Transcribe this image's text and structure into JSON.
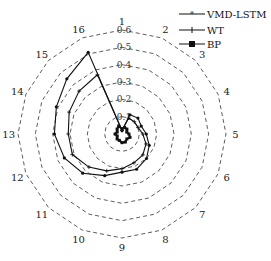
{
  "chart_data": {
    "type": "radar",
    "title": "",
    "axes": [
      "1",
      "2",
      "3",
      "4",
      "5",
      "6",
      "7",
      "8",
      "9",
      "10",
      "11",
      "12",
      "13",
      "14",
      "15",
      "16"
    ],
    "radial_ticks": [
      "0.1",
      "0.2",
      "0.3",
      "0.4",
      "0.5",
      "0.6"
    ],
    "rlim": [
      0,
      0.6
    ],
    "grid": "dashed polygon",
    "legend_position": "top-right",
    "series": [
      {
        "name": "VMD-LSTM",
        "marker": "star",
        "values": [
          0.02,
          0.12,
          0.13,
          0.12,
          0.14,
          0.17,
          0.2,
          0.22,
          0.22,
          0.26,
          0.32,
          0.36,
          0.39,
          0.41,
          0.45,
          0.51
        ]
      },
      {
        "name": "WT",
        "marker": "plus",
        "values": [
          0.02,
          0.1,
          0.1,
          0.1,
          0.12,
          0.15,
          0.17,
          0.18,
          0.2,
          0.23,
          0.27,
          0.31,
          0.31,
          0.33,
          0.35,
          0.37
        ]
      },
      {
        "name": "BP",
        "marker": "square",
        "values": [
          0.03,
          0.04,
          0.04,
          0.03,
          0.04,
          0.05,
          0.04,
          0.05,
          0.05,
          0.04,
          0.04,
          0.03,
          0.04,
          0.03,
          0.04,
          0.05
        ]
      }
    ]
  },
  "legend": {
    "items": [
      "VMD-LSTM",
      "WT",
      "BP"
    ]
  }
}
